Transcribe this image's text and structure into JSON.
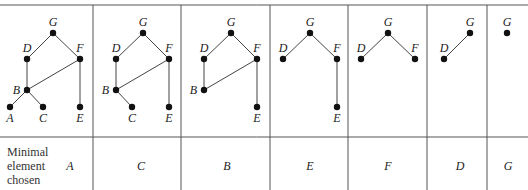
{
  "row_label": [
    "Minimal",
    "element",
    "chosen"
  ],
  "panels": [
    {
      "x0": 0,
      "x1": 93,
      "chosen": "A",
      "chosen_x": 70,
      "nodes": [
        {
          "id": "G",
          "x": 53,
          "y": 33,
          "lx": 53,
          "ly": 26,
          "anchor": "middle"
        },
        {
          "id": "D",
          "x": 27,
          "y": 59,
          "lx": 27,
          "ly": 52,
          "anchor": "middle"
        },
        {
          "id": "F",
          "x": 80,
          "y": 59,
          "lx": 80,
          "ly": 52,
          "anchor": "middle"
        },
        {
          "id": "B",
          "x": 27,
          "y": 90,
          "lx": 20,
          "ly": 94,
          "anchor": "end"
        },
        {
          "id": "A",
          "x": 10,
          "y": 107,
          "lx": 10,
          "ly": 122,
          "anchor": "middle"
        },
        {
          "id": "C",
          "x": 43,
          "y": 107,
          "lx": 43,
          "ly": 122,
          "anchor": "middle"
        },
        {
          "id": "E",
          "x": 80,
          "y": 107,
          "lx": 80,
          "ly": 122,
          "anchor": "middle"
        }
      ],
      "edges": [
        [
          "G",
          "D"
        ],
        [
          "G",
          "F"
        ],
        [
          "D",
          "B"
        ],
        [
          "F",
          "B"
        ],
        [
          "F",
          "E"
        ],
        [
          "B",
          "A"
        ],
        [
          "B",
          "C"
        ]
      ]
    },
    {
      "x0": 93,
      "x1": 181,
      "chosen": "C",
      "chosen_x": 141,
      "nodes": [
        {
          "id": "G",
          "x": 143,
          "y": 33,
          "lx": 143,
          "ly": 26,
          "anchor": "middle"
        },
        {
          "id": "D",
          "x": 116,
          "y": 59,
          "lx": 116,
          "ly": 52,
          "anchor": "middle"
        },
        {
          "id": "F",
          "x": 169,
          "y": 59,
          "lx": 169,
          "ly": 52,
          "anchor": "middle"
        },
        {
          "id": "B",
          "x": 116,
          "y": 90,
          "lx": 109,
          "ly": 94,
          "anchor": "end"
        },
        {
          "id": "C",
          "x": 132,
          "y": 107,
          "lx": 132,
          "ly": 122,
          "anchor": "middle"
        },
        {
          "id": "E",
          "x": 169,
          "y": 107,
          "lx": 169,
          "ly": 122,
          "anchor": "middle"
        }
      ],
      "edges": [
        [
          "G",
          "D"
        ],
        [
          "G",
          "F"
        ],
        [
          "D",
          "B"
        ],
        [
          "F",
          "B"
        ],
        [
          "F",
          "E"
        ],
        [
          "B",
          "C"
        ]
      ]
    },
    {
      "x0": 181,
      "x1": 270,
      "chosen": "B",
      "chosen_x": 227,
      "nodes": [
        {
          "id": "G",
          "x": 231,
          "y": 33,
          "lx": 231,
          "ly": 26,
          "anchor": "middle"
        },
        {
          "id": "D",
          "x": 204,
          "y": 59,
          "lx": 204,
          "ly": 52,
          "anchor": "middle"
        },
        {
          "id": "F",
          "x": 257,
          "y": 59,
          "lx": 257,
          "ly": 52,
          "anchor": "middle"
        },
        {
          "id": "B",
          "x": 204,
          "y": 90,
          "lx": 197,
          "ly": 94,
          "anchor": "end"
        },
        {
          "id": "E",
          "x": 257,
          "y": 107,
          "lx": 257,
          "ly": 122,
          "anchor": "middle"
        }
      ],
      "edges": [
        [
          "G",
          "D"
        ],
        [
          "G",
          "F"
        ],
        [
          "D",
          "B"
        ],
        [
          "F",
          "B"
        ],
        [
          "F",
          "E"
        ]
      ]
    },
    {
      "x0": 270,
      "x1": 348,
      "chosen": "E",
      "chosen_x": 310,
      "nodes": [
        {
          "id": "G",
          "x": 310,
          "y": 33,
          "lx": 310,
          "ly": 26,
          "anchor": "middle"
        },
        {
          "id": "D",
          "x": 283,
          "y": 59,
          "lx": 283,
          "ly": 52,
          "anchor": "middle"
        },
        {
          "id": "F",
          "x": 337,
          "y": 59,
          "lx": 337,
          "ly": 52,
          "anchor": "middle"
        },
        {
          "id": "E",
          "x": 337,
          "y": 107,
          "lx": 337,
          "ly": 122,
          "anchor": "middle"
        }
      ],
      "edges": [
        [
          "G",
          "D"
        ],
        [
          "G",
          "F"
        ],
        [
          "F",
          "E"
        ]
      ]
    },
    {
      "x0": 348,
      "x1": 427,
      "chosen": "F",
      "chosen_x": 388,
      "nodes": [
        {
          "id": "G",
          "x": 388,
          "y": 33,
          "lx": 388,
          "ly": 26,
          "anchor": "middle"
        },
        {
          "id": "D",
          "x": 361,
          "y": 59,
          "lx": 361,
          "ly": 52,
          "anchor": "middle"
        },
        {
          "id": "F",
          "x": 415,
          "y": 59,
          "lx": 415,
          "ly": 52,
          "anchor": "middle"
        }
      ],
      "edges": [
        [
          "G",
          "D"
        ],
        [
          "G",
          "F"
        ]
      ]
    },
    {
      "x0": 427,
      "x1": 487,
      "chosen": "D",
      "chosen_x": 460,
      "nodes": [
        {
          "id": "G",
          "x": 470,
          "y": 33,
          "lx": 470,
          "ly": 26,
          "anchor": "middle"
        },
        {
          "id": "D",
          "x": 444,
          "y": 59,
          "lx": 444,
          "ly": 52,
          "anchor": "middle"
        }
      ],
      "edges": [
        [
          "G",
          "D"
        ]
      ]
    },
    {
      "x0": 487,
      "x1": 528,
      "chosen": "G",
      "chosen_x": 508,
      "nodes": [
        {
          "id": "G",
          "x": 507,
          "y": 33,
          "lx": 507,
          "ly": 26,
          "anchor": "middle"
        }
      ],
      "edges": []
    }
  ],
  "layout": {
    "top_y": 5,
    "mid_y": 137,
    "bottom_y": 190,
    "width": 528,
    "chosen_y": 170
  }
}
